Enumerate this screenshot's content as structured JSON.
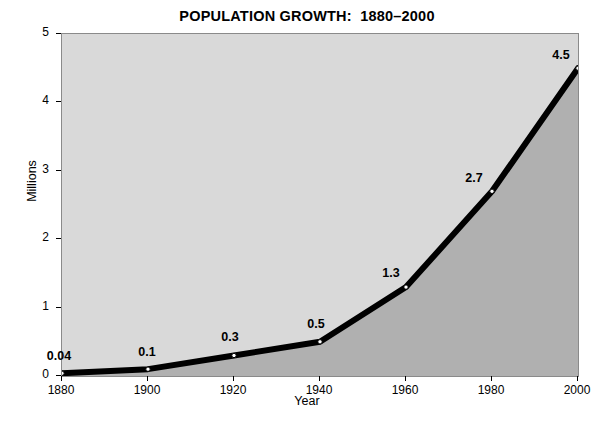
{
  "chart_data": {
    "type": "line",
    "title": "POPULATION GROWTH:  1880–2000",
    "xlabel": "Year",
    "ylabel": "Millions",
    "x": [
      1880,
      1900,
      1920,
      1940,
      1960,
      1980,
      2000
    ],
    "values": [
      0.04,
      0.1,
      0.3,
      0.5,
      1.3,
      2.7,
      4.5
    ],
    "point_labels": [
      "0.04",
      "0.1",
      "0.3",
      "0.5",
      "1.3",
      "2.7",
      "4.5"
    ],
    "xlim": [
      1880,
      2000
    ],
    "ylim": [
      0,
      5
    ],
    "xticks": [
      1880,
      1900,
      1920,
      1940,
      1960,
      1980,
      2000
    ],
    "xtick_labels": [
      "1880",
      "1900",
      "1920",
      "1940",
      "1960",
      "1980",
      "2000"
    ],
    "yticks": [
      0,
      1,
      2,
      3,
      4,
      5
    ],
    "ytick_labels": [
      "0",
      "1",
      "2",
      "3",
      "4",
      "5"
    ],
    "grid": false,
    "legend": null,
    "series_name": "Population",
    "colors": {
      "page_background": "#ffffff",
      "plot_background": "#d9d9d9",
      "area_fill": "#b0b0b0",
      "line": "#000000",
      "marker_face": "#ffffff",
      "marker_edge": "#000000",
      "plot_border": "#8a8a8a",
      "text": "#000000"
    }
  }
}
